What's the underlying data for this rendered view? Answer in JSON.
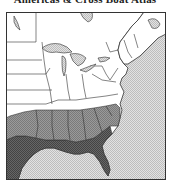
{
  "title": "Americas & Cross Boat Atlas",
  "map": {
    "region": "Eastern United States",
    "colors": {
      "land": "#ffffff",
      "water": "#d4d4d4",
      "zone_medium": "#8c8c8c",
      "zone_dark": "#5a5a5a",
      "border": "#333333"
    },
    "legend": []
  }
}
